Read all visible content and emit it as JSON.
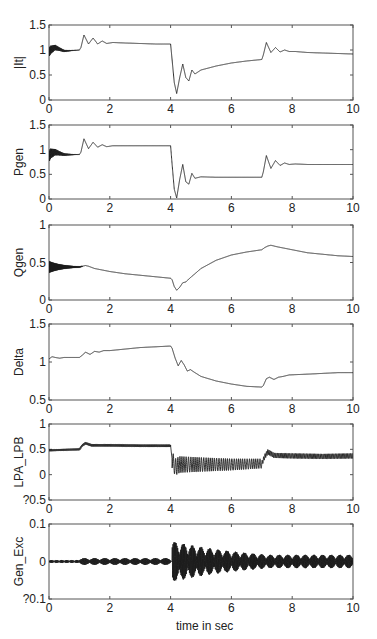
{
  "figure": {
    "xlabel": "time in sec",
    "line_color": "#1a1a1a",
    "axis_color": "#555555"
  },
  "chart_data": [
    {
      "type": "line",
      "ylabel": "|It|",
      "xlim": [
        0,
        10
      ],
      "ylim": [
        0,
        1.5
      ],
      "xticks": [
        0,
        2,
        4,
        6,
        8,
        10
      ],
      "yticks": [
        0,
        0.5,
        1,
        1.5
      ],
      "ytick_labels": [
        "0",
        "0.5",
        "1",
        "1.5"
      ],
      "grid": false,
      "box": {
        "top": 25,
        "bottom": 100
      },
      "osc": {
        "start": 0,
        "end": 1.0,
        "amp": 0.1,
        "decay": 3,
        "freq": 40
      },
      "series": [
        {
          "x": [
            0,
            0.05,
            0.2,
            0.5,
            1.0,
            1.05,
            1.15,
            1.3,
            1.45,
            1.6,
            1.75,
            1.9,
            2.1,
            2.5,
            3.0,
            3.5,
            4.0,
            4.05,
            4.12,
            4.2,
            4.3,
            4.4,
            4.5,
            4.6,
            4.7,
            4.8,
            5.0,
            5.5,
            6.0,
            6.5,
            7.0,
            7.05,
            7.15,
            7.3,
            7.45,
            7.6,
            7.75,
            7.9,
            8.1,
            8.5,
            9.0,
            9.5,
            10.0
          ],
          "y": [
            0.95,
            1.0,
            1.05,
            0.98,
            1.0,
            1.05,
            1.3,
            1.12,
            1.24,
            1.12,
            1.18,
            1.13,
            1.15,
            1.14,
            1.13,
            1.12,
            1.12,
            0.8,
            0.35,
            0.13,
            0.45,
            0.72,
            0.45,
            0.38,
            0.6,
            0.52,
            0.6,
            0.68,
            0.74,
            0.78,
            0.81,
            0.9,
            1.15,
            0.95,
            1.05,
            0.96,
            1.0,
            0.97,
            0.97,
            0.95,
            0.94,
            0.93,
            0.92
          ]
        }
      ]
    },
    {
      "type": "line",
      "ylabel": "Pgen",
      "xlim": [
        0,
        10
      ],
      "ylim": [
        0,
        1.5
      ],
      "xticks": [
        0,
        2,
        4,
        6,
        8,
        10
      ],
      "yticks": [
        0,
        0.5,
        1,
        1.5
      ],
      "ytick_labels": [
        "0",
        "0.5",
        "1",
        "1.5"
      ],
      "grid": false,
      "box": {
        "top": 125,
        "bottom": 199
      },
      "osc": {
        "start": 0,
        "end": 1.0,
        "amp": 0.12,
        "decay": 3,
        "freq": 40
      },
      "series": [
        {
          "x": [
            0,
            0.05,
            0.2,
            0.5,
            1.0,
            1.05,
            1.15,
            1.3,
            1.45,
            1.6,
            1.75,
            1.9,
            2.1,
            2.5,
            3.0,
            4.0,
            4.05,
            4.12,
            4.2,
            4.3,
            4.4,
            4.5,
            4.6,
            4.7,
            4.8,
            5.0,
            5.5,
            6.0,
            6.5,
            7.0,
            7.05,
            7.15,
            7.3,
            7.45,
            7.6,
            7.75,
            7.9,
            8.1,
            8.5,
            9.0,
            10.0
          ],
          "y": [
            0.85,
            0.92,
            0.95,
            0.9,
            0.9,
            0.95,
            1.22,
            1.02,
            1.15,
            1.05,
            1.1,
            1.06,
            1.08,
            1.08,
            1.08,
            1.08,
            0.7,
            0.2,
            0.02,
            0.4,
            0.7,
            0.35,
            0.3,
            0.52,
            0.42,
            0.45,
            0.44,
            0.44,
            0.44,
            0.44,
            0.55,
            0.88,
            0.62,
            0.78,
            0.68,
            0.73,
            0.7,
            0.71,
            0.7,
            0.7,
            0.7
          ]
        }
      ]
    },
    {
      "type": "line",
      "ylabel": "Qgen",
      "xlim": [
        0,
        10
      ],
      "ylim": [
        0,
        1
      ],
      "xticks": [
        0,
        2,
        4,
        6,
        8,
        10
      ],
      "yticks": [
        0,
        0.5,
        1
      ],
      "ytick_labels": [
        "0",
        "0.5",
        "1"
      ],
      "grid": false,
      "box": {
        "top": 225,
        "bottom": 300
      },
      "osc": {
        "start": 0,
        "end": 1.1,
        "amp": 0.09,
        "decay": 2.2,
        "freq": 50
      },
      "series": [
        {
          "x": [
            0,
            0.5,
            1.0,
            1.2,
            1.3,
            1.5,
            2.0,
            2.5,
            3.0,
            3.5,
            4.0,
            4.05,
            4.12,
            4.2,
            4.3,
            4.4,
            4.5,
            4.6,
            4.8,
            5.0,
            5.5,
            6.0,
            6.5,
            7.0,
            7.1,
            7.2,
            7.3,
            7.5,
            8.0,
            8.5,
            9.0,
            9.5,
            10.0
          ],
          "y": [
            0.44,
            0.44,
            0.44,
            0.46,
            0.45,
            0.42,
            0.38,
            0.35,
            0.33,
            0.31,
            0.29,
            0.27,
            0.18,
            0.13,
            0.17,
            0.23,
            0.24,
            0.28,
            0.35,
            0.42,
            0.53,
            0.6,
            0.64,
            0.67,
            0.7,
            0.72,
            0.73,
            0.71,
            0.67,
            0.63,
            0.61,
            0.59,
            0.58
          ]
        }
      ]
    },
    {
      "type": "line",
      "ylabel": "Delta",
      "xlim": [
        0,
        10
      ],
      "ylim": [
        0.5,
        1.5
      ],
      "xticks": [
        0,
        2,
        4,
        6,
        8,
        10
      ],
      "yticks": [
        0.5,
        1,
        1.5
      ],
      "ytick_labels": [
        "0.5",
        "1",
        "1.5"
      ],
      "grid": false,
      "box": {
        "top": 324,
        "bottom": 400
      },
      "osc": null,
      "series": [
        {
          "x": [
            0,
            0.1,
            0.2,
            0.35,
            0.5,
            0.7,
            1.0,
            1.1,
            1.2,
            1.35,
            1.5,
            1.65,
            1.8,
            2.0,
            2.5,
            3.0,
            3.5,
            4.0,
            4.05,
            4.15,
            4.25,
            4.35,
            4.45,
            4.55,
            4.65,
            4.8,
            5.0,
            5.5,
            6.0,
            6.5,
            7.0,
            7.05,
            7.15,
            7.25,
            7.4,
            7.55,
            7.7,
            7.9,
            8.5,
            9.0,
            9.5,
            10.0
          ],
          "y": [
            1.04,
            1.07,
            1.06,
            1.05,
            1.06,
            1.06,
            1.06,
            1.09,
            1.13,
            1.1,
            1.14,
            1.13,
            1.15,
            1.15,
            1.17,
            1.19,
            1.2,
            1.21,
            1.18,
            1.05,
            0.95,
            1.02,
            0.96,
            0.88,
            0.9,
            0.86,
            0.81,
            0.75,
            0.71,
            0.68,
            0.67,
            0.69,
            0.78,
            0.8,
            0.77,
            0.8,
            0.81,
            0.83,
            0.84,
            0.85,
            0.86,
            0.86
          ]
        }
      ]
    },
    {
      "type": "line",
      "ylabel": "LPA_LPB",
      "xlim": [
        0,
        10
      ],
      "ylim": [
        -0.5,
        1
      ],
      "xticks": [
        0,
        2,
        4,
        6,
        8,
        10
      ],
      "yticks": [
        -0.5,
        0,
        0.5,
        1
      ],
      "ytick_labels": [
        "?0.5",
        "0",
        "0.5",
        "1"
      ],
      "grid": false,
      "box": {
        "top": 424,
        "bottom": 500
      },
      "noise": [
        {
          "start": 0,
          "end": 1.0,
          "amp": 0.02,
          "freq": 30
        },
        {
          "start": 1.0,
          "end": 4.0,
          "amp": 0.025,
          "freq": 30
        },
        {
          "start": 4.05,
          "end": 7.0,
          "amp": 0.17,
          "freq": 14,
          "decay": 0.2
        },
        {
          "start": 7.0,
          "end": 10.0,
          "amp": 0.05,
          "freq": 22
        }
      ],
      "series": [
        {
          "x": [
            0,
            1.0,
            1.1,
            1.2,
            1.4,
            2.0,
            3.0,
            4.0,
            4.05,
            4.15,
            4.3,
            5.0,
            6.0,
            7.0,
            7.1,
            7.2,
            7.4,
            8.0,
            9.0,
            10.0
          ],
          "y": [
            0.48,
            0.5,
            0.58,
            0.62,
            0.58,
            0.58,
            0.57,
            0.57,
            0.3,
            0.15,
            0.2,
            0.2,
            0.2,
            0.22,
            0.36,
            0.45,
            0.38,
            0.37,
            0.36,
            0.37
          ]
        }
      ]
    },
    {
      "type": "line",
      "ylabel": "Gen_Exc",
      "xlim": [
        0,
        10
      ],
      "ylim": [
        -0.1,
        0.1
      ],
      "xticks": [
        0,
        2,
        4,
        6,
        8,
        10
      ],
      "yticks": [
        -0.1,
        0,
        0.1
      ],
      "ytick_labels": [
        "?0.1",
        "0",
        "0.1"
      ],
      "grid": false,
      "box": {
        "top": 524,
        "bottom": 599
      },
      "noise": [
        {
          "start": 0,
          "end": 1.0,
          "amp": 0.004,
          "freq": 40,
          "beat": 6
        },
        {
          "start": 1.0,
          "end": 4.0,
          "amp": 0.009,
          "freq": 40,
          "beat": 3
        },
        {
          "start": 4.05,
          "end": 10.0,
          "amp": 0.055,
          "freq": 40,
          "beat": 3.5,
          "decay": 0.35,
          "floor": 0.018
        }
      ],
      "series": [
        {
          "x": [
            0,
            10
          ],
          "y": [
            0,
            0
          ]
        }
      ]
    }
  ]
}
